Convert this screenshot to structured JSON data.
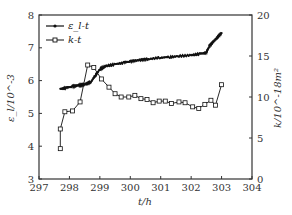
{
  "chart_data": {
    "type": "line",
    "title": "",
    "xlabel": "t/h",
    "ylabel_left": "ε_l/10^-3",
    "ylabel_right": "k/10^-18m²",
    "xlim": [
      297,
      304
    ],
    "ylim_left": [
      3,
      8
    ],
    "ylim_right": [
      0,
      20
    ],
    "x_ticks": [
      "297",
      "298",
      "299",
      "300",
      "301",
      "302",
      "303",
      "304"
    ],
    "y_left_ticks": [
      "3",
      "4",
      "5",
      "6",
      "7",
      "8"
    ],
    "y_right_ticks": [
      "0",
      "5",
      "10",
      "15",
      "20"
    ],
    "grid": false,
    "legend_position": "upper-left",
    "legend": [
      "ε_l-t",
      "k-t"
    ],
    "series": [
      {
        "name": "ε_l-t",
        "axis": "left",
        "marker": "small-filled-dot",
        "x": [
          297.7,
          297.9,
          298.1,
          298.3,
          298.5,
          298.7,
          298.85,
          299.0,
          299.2,
          299.5,
          299.8,
          300.0,
          300.3,
          300.6,
          301.0,
          301.3,
          301.6,
          302.0,
          302.3,
          302.5,
          302.6,
          302.8,
          303.0
        ],
        "values": [
          5.75,
          5.78,
          5.82,
          5.85,
          5.88,
          5.95,
          6.15,
          6.35,
          6.45,
          6.5,
          6.55,
          6.58,
          6.62,
          6.65,
          6.7,
          6.72,
          6.75,
          6.78,
          6.82,
          6.85,
          7.05,
          7.25,
          7.45
        ]
      },
      {
        "name": "k-t",
        "axis": "right",
        "marker": "open-square",
        "x": [
          297.7,
          297.7,
          297.85,
          298.1,
          298.35,
          298.6,
          298.8,
          299.05,
          299.3,
          299.5,
          299.7,
          299.95,
          300.15,
          300.35,
          300.55,
          300.75,
          300.95,
          301.15,
          301.35,
          301.6,
          301.8,
          302.05,
          302.25,
          302.45,
          302.65,
          302.8,
          303.0
        ],
        "values": [
          3.7,
          6.1,
          8.2,
          8.3,
          9.4,
          13.9,
          13.6,
          12.2,
          11.2,
          10.4,
          10.0,
          10.0,
          10.2,
          9.8,
          9.7,
          9.3,
          9.5,
          9.5,
          9.2,
          9.4,
          9.3,
          8.8,
          8.6,
          9.1,
          9.6,
          9.0,
          11.5
        ]
      }
    ]
  },
  "colors": {
    "line": "#111111",
    "axis": "#333333",
    "background": "#ffffff"
  }
}
